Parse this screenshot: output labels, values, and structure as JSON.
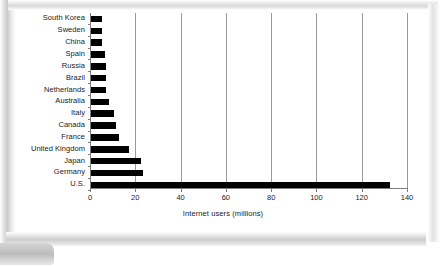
{
  "chart_data": {
    "type": "bar",
    "orientation": "horizontal",
    "title": "",
    "xlabel": "Internet users (millions)",
    "ylabel": "",
    "xlim": [
      0,
      140
    ],
    "xticks": [
      0,
      20,
      40,
      60,
      80,
      100,
      120,
      140
    ],
    "grid": true,
    "legend": false,
    "bar_color": "#000000",
    "categories": [
      "South Korea",
      "Sweden",
      "China",
      "Spain",
      "Russia",
      "Brazil",
      "Netherlands",
      "Australia",
      "Italy",
      "Canada",
      "France",
      "United Kingdom",
      "Japan",
      "Germany",
      "U.S."
    ],
    "values": [
      5,
      5,
      5,
      6,
      6.5,
      6.5,
      6.5,
      8,
      10,
      11,
      12.5,
      17,
      22,
      23,
      132
    ]
  },
  "slide": {
    "background_color": "#ffffff",
    "frame_color": "#c9c9c9"
  }
}
